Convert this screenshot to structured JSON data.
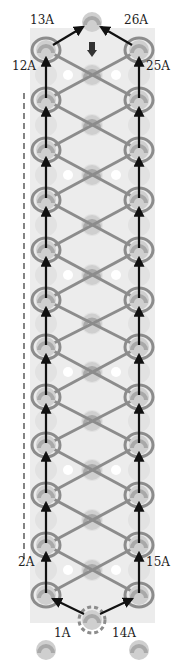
{
  "diagram": {
    "type": "rainbow-loom-style band pattern",
    "colors": {
      "background_band": "#ececec",
      "peg": "#a9a9a9",
      "peg_light": "#cfcfcf",
      "hole": "#ffffff",
      "band": "#8c8c8c",
      "arrow": "#111111",
      "dashed_line": "#333333"
    },
    "columns": {
      "left_x": 46,
      "center_x": 92,
      "right_x": 139
    },
    "rows_y": [
      50,
      100,
      150,
      200,
      250,
      300,
      347,
      397,
      445,
      495,
      545,
      595
    ],
    "start_peg": {
      "x": 92,
      "y": 620,
      "style": "dashed-circle"
    },
    "top_peg": {
      "x": 92,
      "y": 22
    },
    "bottom_pegs_y": 650,
    "dashed_line": {
      "x": 24,
      "y1": 93,
      "y2": 560
    },
    "labels": [
      {
        "id": "1A",
        "text": "1A",
        "x": 54,
        "y": 637
      },
      {
        "id": "14A",
        "text": "14A",
        "x": 112,
        "y": 637
      },
      {
        "id": "2A",
        "text": "2A",
        "x": 18,
        "y": 566
      },
      {
        "id": "15A",
        "text": "15A",
        "x": 146,
        "y": 566
      },
      {
        "id": "12A",
        "text": "12A",
        "x": 12,
        "y": 70
      },
      {
        "id": "25A",
        "text": "25A",
        "x": 146,
        "y": 70
      },
      {
        "id": "13A",
        "text": "13A",
        "x": 30,
        "y": 24
      },
      {
        "id": "26A",
        "text": "26A",
        "x": 124,
        "y": 24
      }
    ]
  }
}
